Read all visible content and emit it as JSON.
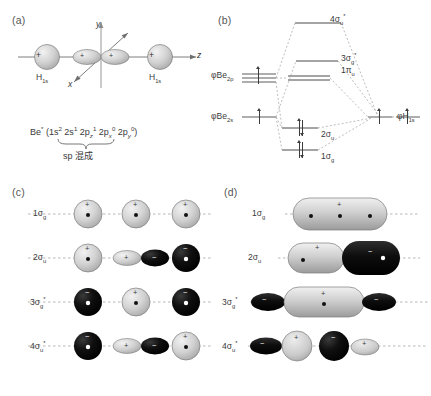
{
  "figure": {
    "panels": [
      {
        "id": "a",
        "letter": "(a)"
      },
      {
        "id": "b",
        "letter": "(b)"
      },
      {
        "id": "c",
        "letter": "(c)"
      },
      {
        "id": "d",
        "letter": "(d)"
      }
    ]
  },
  "panel_a": {
    "letter": "(a)",
    "axes": {
      "y": "y",
      "z": "z",
      "x": "x"
    },
    "atom_left_label": "H",
    "atom_left_sub": "1s",
    "atom_right_label": "H",
    "atom_right_sub": "1s",
    "orbital_sign_left": "+",
    "orbital_sign_right": "+",
    "lobe_sign_left": "+",
    "lobe_sign_right": "+",
    "config_prefix": "Be",
    "config_star": "*",
    "config_body": "(1s",
    "config_terms": [
      {
        "base": "1s",
        "sup": "2"
      },
      {
        "base": "2s",
        "sup": "1"
      },
      {
        "base": "2p",
        "sub": "z",
        "sup": "1"
      },
      {
        "base": "2p",
        "sub": "x",
        "sup": "0"
      },
      {
        "base": "2p",
        "sub": "y",
        "sup": "0"
      }
    ],
    "hybrid_note": "sp 混成"
  },
  "panel_b": {
    "letter": "(b)",
    "left_labels": [
      {
        "phi": "φ",
        "atom": "Be",
        "sub": "2p"
      },
      {
        "phi": "φ",
        "atom": "Be",
        "sub": "2s"
      }
    ],
    "right_label": {
      "phi": "φ",
      "atom": "H",
      "sub": "1s"
    },
    "mo_levels": [
      {
        "name": "4σ",
        "sub": "u",
        "star": "*",
        "occupancy": 0
      },
      {
        "name": "3σ",
        "sub": "g",
        "star": "*",
        "occupancy": 0
      },
      {
        "name": "1π",
        "sub": "u",
        "star": "",
        "occupancy": 0
      },
      {
        "name": "2σ",
        "sub": "u",
        "star": "",
        "occupancy": 2
      },
      {
        "name": "1σ",
        "sub": "g",
        "star": "",
        "occupancy": 2
      }
    ],
    "ao_electrons": {
      "Be2p": "one electron (single up arrow)",
      "Be2s": "one electron (single up arrow)",
      "H1s_left": "one electron (single up arrow)",
      "H1s_right": "one electron (single up arrow)"
    }
  },
  "panel_c": {
    "letter": "(c)",
    "caption_hint": "basis atomic orbital combinations",
    "rows": [
      {
        "label_base": "1σ",
        "label_sub": "g",
        "label_star": "",
        "items": [
          {
            "type": "sphere",
            "fill": "grey",
            "sign": "+",
            "dot": true
          },
          {
            "type": "sphere",
            "fill": "grey",
            "sign": "+",
            "dot": true
          },
          {
            "type": "sphere",
            "fill": "grey",
            "sign": "+",
            "dot": true
          }
        ]
      },
      {
        "label_base": "2σ",
        "label_sub": "u",
        "label_star": "",
        "items": [
          {
            "type": "sphere",
            "fill": "grey",
            "sign": "+",
            "dot": true
          },
          {
            "type": "p-orbital",
            "left_fill": "grey",
            "left_sign": "+",
            "right_fill": "black",
            "right_sign": "−"
          },
          {
            "type": "sphere",
            "fill": "black",
            "sign": "−",
            "dot": true
          }
        ]
      },
      {
        "label_base": "3σ",
        "label_sub": "g",
        "label_star": "*",
        "items": [
          {
            "type": "sphere",
            "fill": "black",
            "sign": "−",
            "dot": true
          },
          {
            "type": "sphere",
            "fill": "grey",
            "sign": "+",
            "dot": true
          },
          {
            "type": "sphere",
            "fill": "black",
            "sign": "−",
            "dot": true
          }
        ]
      },
      {
        "label_base": "4σ",
        "label_sub": "u",
        "label_star": "*",
        "items": [
          {
            "type": "sphere",
            "fill": "black",
            "sign": "−",
            "dot": true
          },
          {
            "type": "p-orbital",
            "left_fill": "grey",
            "left_sign": "+",
            "right_fill": "black",
            "right_sign": "−"
          },
          {
            "type": "sphere",
            "fill": "grey",
            "sign": "+",
            "dot": true
          }
        ]
      }
    ]
  },
  "panel_d": {
    "letter": "(d)",
    "caption_hint": "resulting delocalized molecular orbitals",
    "rows": [
      {
        "label_base": "1σ",
        "label_sub": "g",
        "label_star": "",
        "shape": "single-elongated-grey",
        "signs": [
          "+"
        ],
        "dots": 3
      },
      {
        "label_base": "2σ",
        "label_sub": "u",
        "label_star": "",
        "shape": "two-lobe-grey-black",
        "signs": [
          "+",
          "−"
        ],
        "dots": 2
      },
      {
        "label_base": "3σ",
        "label_sub": "g",
        "label_star": "*",
        "shape": "black-grey-black",
        "signs": [
          "−",
          "+",
          "−"
        ],
        "dots": 1
      },
      {
        "label_base": "4σ",
        "label_sub": "u",
        "label_star": "*",
        "shape": "black-grey-black-grey",
        "signs": [
          "−",
          "+",
          "−",
          "+"
        ],
        "dots": 0
      }
    ]
  },
  "colors": {
    "positive_lobe": "#c9c9c9",
    "negative_lobe": "#121212",
    "axis": "#6f6f6f",
    "dashed": "#8d8d8d",
    "text": "#3a3a3a"
  }
}
